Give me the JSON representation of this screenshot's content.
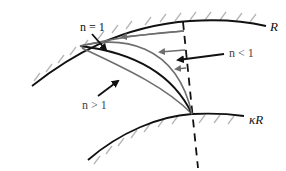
{
  "diagram": {
    "labels": {
      "outer_arc": "R",
      "inner_arc": "κR",
      "n_equal_1": "n = 1",
      "n_less_1": "n < 1",
      "n_greater_1": "n > 1"
    },
    "colors": {
      "black_curve": "#111111",
      "gray_curve": "#6e6e6e",
      "hatch": "#b5b5b5"
    }
  }
}
